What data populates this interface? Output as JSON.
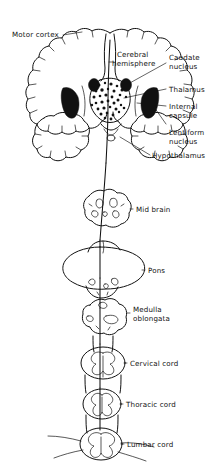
{
  "figure": {
    "ink_color": "#111111",
    "background_color": "#ffffff",
    "style": "hand-drawn anatomical line illustration"
  },
  "labels": {
    "motor_cortex": "Motor cortex",
    "cerebral_hemisphere_line1": "Cerebral",
    "cerebral_hemisphere_line2": "hemisphere",
    "caudate_nucleus_line1": "Caudate",
    "caudate_nucleus_line2": "nucleus",
    "thalamus": "Thalamus",
    "internal_capsule_line1": "Internal",
    "internal_capsule_line2": "capsule",
    "lentiform_nucleus_line1": "Lentiform",
    "lentiform_nucleus_line2": "nucleus",
    "hypothalamus": "Hypothalamus",
    "mid_brain": "Mid brain",
    "pons": "Pons",
    "medulla_oblongata_line1": "Medulla",
    "medulla_oblongata_line2": "oblongata",
    "cervical_cord": "Cervical cord",
    "thoracic_cord": "Thoracic cord",
    "lumbar_cord": "Lumbar cord"
  },
  "structures": [
    {
      "name": "cerebral-coronal-section",
      "label": "Cerebral hemisphere",
      "region": "forebrain"
    },
    {
      "name": "motor-cortex",
      "label": "Motor cortex",
      "region": "forebrain"
    },
    {
      "name": "caudate-nucleus",
      "label": "Caudate nucleus",
      "region": "basal-ganglia"
    },
    {
      "name": "thalamus",
      "label": "Thalamus",
      "region": "diencephalon"
    },
    {
      "name": "internal-capsule",
      "label": "Internal capsule",
      "region": "white-matter"
    },
    {
      "name": "lentiform-nucleus",
      "label": "Lentiform nucleus",
      "region": "basal-ganglia"
    },
    {
      "name": "hypothalamus",
      "label": "Hypothalamus",
      "region": "diencephalon"
    },
    {
      "name": "mid-brain",
      "label": "Mid brain",
      "region": "brainstem"
    },
    {
      "name": "pons",
      "label": "Pons",
      "region": "brainstem"
    },
    {
      "name": "medulla-oblongata",
      "label": "Medulla oblongata",
      "region": "brainstem"
    },
    {
      "name": "cervical-cord",
      "label": "Cervical cord",
      "region": "spinal-cord"
    },
    {
      "name": "thoracic-cord",
      "label": "Thoracic cord",
      "region": "spinal-cord"
    },
    {
      "name": "lumbar-cord",
      "label": "Lumbar cord",
      "region": "spinal-cord"
    }
  ]
}
